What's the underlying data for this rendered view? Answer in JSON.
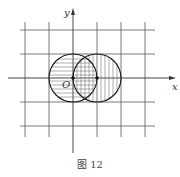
{
  "figure": {
    "caption": "图 12",
    "x_axis_label": "x",
    "y_axis_label": "y",
    "origin_label": "O",
    "grid": {
      "vertical_lines_px": [
        25,
        49,
        73,
        97,
        121,
        145
      ],
      "horizontal_lines_px": [
        30,
        54,
        78,
        102,
        126
      ],
      "unit_px": 24
    },
    "circles": [
      {
        "name": "left-circle",
        "center": [
          0,
          0
        ],
        "radius": 1,
        "hatch": "horizontal"
      },
      {
        "name": "right-circle",
        "center": [
          1,
          0
        ],
        "radius": 1,
        "hatch": "vertical"
      }
    ],
    "points": [
      {
        "name": "origin-point",
        "coords": [
          0,
          0
        ]
      },
      {
        "name": "center-point",
        "coords": [
          1,
          0
        ]
      }
    ],
    "colors": {
      "line": "#333333",
      "grid": "#555555",
      "hatch": "#777777"
    }
  }
}
